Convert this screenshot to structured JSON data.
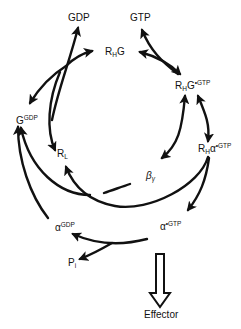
{
  "diagram": {
    "nodes": {
      "gdp": {
        "label": "GDP"
      },
      "gtp": {
        "label": "GTP"
      },
      "rhg": {
        "base": "R",
        "sub": "H",
        "tail": "G"
      },
      "rhg_gtp": {
        "base": "R",
        "sub": "H",
        "tail": "G",
        "sup": "•GTP"
      },
      "g_gdp": {
        "base": "G",
        "sup": "GDP"
      },
      "rl": {
        "base": "R",
        "sub": "L"
      },
      "beta_gamma": {
        "base": "β",
        "sub": "γ"
      },
      "rh_alpha_gtp": {
        "base": "R",
        "sub": "H",
        "tail": "α",
        "sup": "•GTP"
      },
      "alpha_gdp": {
        "base": "α",
        "sup": "GDP"
      },
      "alpha_gtp": {
        "base": "α",
        "sup": "•GTP"
      },
      "pi": {
        "base": "P",
        "sub": "i"
      },
      "effector": {
        "label": "Effector"
      }
    },
    "edges": [
      {
        "from": "G^GDP + R_L",
        "to": "R_H G",
        "note": "releases GDP"
      },
      {
        "from": "R_H G",
        "to": "R_H G•GTP",
        "note": "binds GTP"
      },
      {
        "from": "R_H G•GTP",
        "to": "R_H α•GTP",
        "note": "reversible"
      },
      {
        "from": "R_H G•GTP",
        "to": "β_γ"
      },
      {
        "from": "R_H α•GTP",
        "to": "R_L"
      },
      {
        "from": "R_H α•GTP",
        "to": "α•GTP"
      },
      {
        "from": "α•GTP",
        "to": "α^GDP + P_i",
        "note": "hydrolysis"
      },
      {
        "from": "α^GDP + β_γ",
        "to": "G^GDP"
      },
      {
        "from": "α•GTP",
        "to": "Effector",
        "style": "hollow-arrow"
      }
    ],
    "colors": {
      "ink": "#111111",
      "background": "#ffffff"
    }
  }
}
